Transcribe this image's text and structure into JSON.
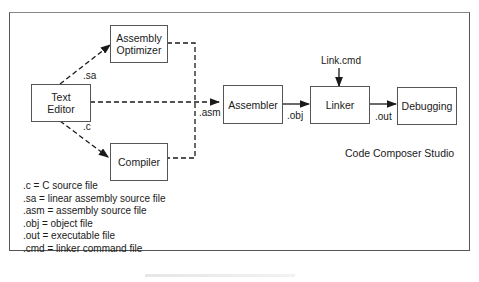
{
  "diagram": {
    "title": "Code Composer Studio",
    "nodes": {
      "text_editor": "Text\nEditor",
      "text_editor_l1": "Text",
      "text_editor_l2": "Editor",
      "assembly_optimizer_l1": "Assembly",
      "assembly_optimizer_l2": "Optimizer",
      "compiler": "Compiler",
      "assembler": "Assembler",
      "linker": "Linker",
      "debugging": "Debugging",
      "link_cmd": "Link.cmd"
    },
    "edge_labels": {
      "sa": ".sa",
      "c": ".c",
      "asm": ".asm",
      "obj": ".obj",
      "out": ".out"
    },
    "edges": [
      {
        "from": "Text Editor",
        "to": "Assembly Optimizer",
        "label": ".sa",
        "style": "dashed"
      },
      {
        "from": "Text Editor",
        "to": "Compiler",
        "label": ".c",
        "style": "dashed"
      },
      {
        "from": "Text Editor",
        "to": "Assembler",
        "label": ".asm",
        "style": "dashed"
      },
      {
        "from": "Assembly Optimizer",
        "to": "Assembler",
        "label": ".asm",
        "style": "dashed"
      },
      {
        "from": "Compiler",
        "to": "Assembler",
        "label": ".asm",
        "style": "dashed"
      },
      {
        "from": "Assembler",
        "to": "Linker",
        "label": ".obj",
        "style": "solid"
      },
      {
        "from": "Link.cmd",
        "to": "Linker",
        "label": "",
        "style": "solid"
      },
      {
        "from": "Linker",
        "to": "Debugging",
        "label": ".out",
        "style": "solid"
      }
    ],
    "legend": [
      ".c = C source file",
      ".sa = linear assembly source file",
      ".asm = assembly source file",
      ".obj = object file",
      ".out = executable file",
      ".cmd = linker command file"
    ],
    "colors": {
      "line": "#1a1a1a",
      "border": "#555555",
      "background": "#ffffff"
    }
  }
}
